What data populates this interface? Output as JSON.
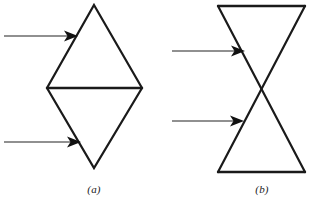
{
  "figure": {
    "domain": "diagram",
    "width": 309,
    "height": 203,
    "background_color": "#ffffff",
    "stroke_color": "#1a1a1a",
    "arrow_color": "#6b6b6b",
    "arrowhead_color": "#111111",
    "panels": [
      {
        "id": "a",
        "caption": "(a)",
        "shape_name": "rhombus-two-triangles",
        "shape_description": "Vertical rhombus split by a horizontal midline into an upper and a lower triangle",
        "vertices": {
          "top_apex": [
            94,
            5
          ],
          "left": [
            47,
            88
          ],
          "right": [
            142,
            88
          ],
          "bottom_apex": [
            94,
            168
          ]
        },
        "midline": {
          "from": [
            47,
            88
          ],
          "to": [
            142,
            88
          ]
        },
        "stroke_width": 2.2,
        "arrows": [
          {
            "name": "upper-arrow",
            "target": "upper-left-edge",
            "tail": [
              4,
              36
            ],
            "head": [
              77,
              36
            ]
          },
          {
            "name": "lower-arrow",
            "target": "lower-left-edge",
            "tail": [
              4,
              142
            ],
            "head": [
              80,
              142
            ]
          }
        ]
      },
      {
        "id": "b",
        "caption": "(b)",
        "shape_name": "hourglass-bowtie",
        "shape_description": "Two triangles meeting apex to apex forming an hourglass, with crossing diagonals",
        "vertices": {
          "top_left": [
            218,
            6
          ],
          "top_right": [
            305,
            6
          ],
          "bottom_left": [
            218,
            172
          ],
          "bottom_right": [
            305,
            172
          ],
          "crossing": [
            262,
            89
          ]
        },
        "top_edge": {
          "from": [
            218,
            6
          ],
          "to": [
            305,
            6
          ]
        },
        "bottom_edge": {
          "from": [
            218,
            172
          ],
          "to": [
            305,
            172
          ]
        },
        "diagonals": [
          {
            "from": [
              218,
              6
            ],
            "to": [
              305,
              172
            ]
          },
          {
            "from": [
              305,
              6
            ],
            "to": [
              218,
              172
            ]
          }
        ],
        "stroke_width": 2.2,
        "arrows": [
          {
            "name": "upper-arrow",
            "target": "upper-left-diagonal",
            "tail": [
              172,
              51
            ],
            "head": [
              244,
              51
            ]
          },
          {
            "name": "lower-arrow",
            "target": "lower-left-diagonal",
            "tail": [
              172,
              121
            ],
            "head": [
              243,
              121
            ]
          }
        ]
      }
    ]
  }
}
